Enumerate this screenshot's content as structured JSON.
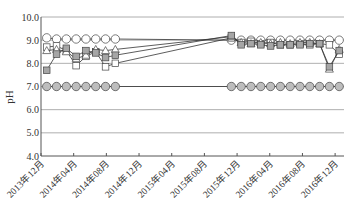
{
  "chart_data": {
    "type": "line",
    "title": "",
    "xlabel": "",
    "ylabel": "pH",
    "ylim": [
      4.0,
      10.0
    ],
    "yticks": [
      "4.0",
      "5.0",
      "6.0",
      "7.0",
      "8.0",
      "9.0",
      "10.0"
    ],
    "grid": "horizontal",
    "legend": "none",
    "x_ticks": [
      {
        "label": "2013年12月",
        "month": 0
      },
      {
        "label": "2014年04月",
        "month": 4
      },
      {
        "label": "2014年08月",
        "month": 8
      },
      {
        "label": "2014年12月",
        "month": 12
      },
      {
        "label": "2015年04月",
        "month": 16
      },
      {
        "label": "2015年08月",
        "month": 20
      },
      {
        "label": "2015年12月",
        "month": 24
      },
      {
        "label": "2016年04月",
        "month": 28
      },
      {
        "label": "2016年08月",
        "month": 32
      },
      {
        "label": "2016年12月",
        "month": 36
      }
    ],
    "x_unit": "months since 2013-12",
    "series": [
      {
        "name": "open-circle",
        "marker": "circle",
        "fill": "#ffffff",
        "x": [
          0.7,
          1.9,
          3.1,
          4.3,
          5.5,
          6.7,
          7.9,
          9.1,
          23.3,
          24.5,
          25.7,
          26.9,
          28.1,
          29.3,
          30.5,
          31.7,
          32.9,
          34.1,
          35.3,
          36.5
        ],
        "values": [
          9.1,
          9.05,
          9.05,
          9.05,
          9.05,
          9.05,
          9.05,
          9.05,
          9.0,
          9.0,
          9.0,
          9.0,
          9.0,
          9.0,
          9.0,
          9.0,
          9.0,
          9.0,
          9.0,
          9.0
        ]
      },
      {
        "name": "grey-circle",
        "marker": "circle",
        "fill": "#bdbdbd",
        "x": [
          0.7,
          1.9,
          3.1,
          4.3,
          5.5,
          6.7,
          7.9,
          9.1,
          23.3,
          24.5,
          25.7,
          26.9,
          28.1,
          29.3,
          30.5,
          31.7,
          32.9,
          34.1,
          35.3,
          36.5
        ],
        "values": [
          7.0,
          7.0,
          7.0,
          7.0,
          7.0,
          7.0,
          7.0,
          7.0,
          7.0,
          7.0,
          7.0,
          7.0,
          7.0,
          7.0,
          7.0,
          7.0,
          7.0,
          7.0,
          7.0,
          7.0
        ]
      },
      {
        "name": "open-square",
        "marker": "square",
        "fill": "#ffffff",
        "x": [
          0.7,
          1.9,
          3.1,
          4.3,
          5.5,
          6.7,
          7.9,
          9.1,
          23.3,
          24.5,
          25.7,
          26.9,
          28.1,
          29.3,
          30.5,
          31.7,
          32.9,
          34.1,
          35.3,
          36.5
        ],
        "values": [
          8.7,
          8.75,
          8.55,
          7.9,
          8.3,
          8.5,
          7.85,
          8.0,
          9.1,
          8.9,
          8.95,
          8.85,
          8.9,
          8.8,
          8.8,
          8.85,
          8.8,
          8.85,
          8.8,
          8.4
        ]
      },
      {
        "name": "open-triangle",
        "marker": "triangle",
        "fill": "#ffffff",
        "x": [
          0.7,
          1.9,
          3.1,
          4.3,
          5.5,
          6.7,
          7.9,
          9.1,
          23.3,
          24.5,
          25.7,
          26.9,
          28.1,
          29.3,
          30.5,
          31.7,
          32.9,
          34.1,
          35.3,
          36.5
        ],
        "values": [
          8.55,
          8.6,
          8.5,
          8.2,
          8.35,
          8.6,
          8.55,
          8.6,
          9.15,
          8.9,
          8.85,
          8.9,
          8.85,
          8.9,
          8.85,
          8.9,
          8.9,
          8.85,
          7.75,
          8.6
        ]
      },
      {
        "name": "grey-square",
        "marker": "square",
        "fill": "#a6a6a6",
        "x": [
          0.7,
          1.9,
          3.1,
          4.3,
          5.5,
          6.7,
          7.9,
          9.1,
          23.3,
          24.5,
          25.7,
          26.9,
          28.1,
          29.3,
          30.5,
          31.7,
          32.9,
          34.1,
          35.3,
          36.5
        ],
        "values": [
          7.7,
          8.4,
          8.65,
          8.3,
          8.55,
          8.45,
          8.25,
          8.35,
          9.2,
          8.8,
          8.85,
          8.8,
          8.75,
          8.8,
          8.8,
          8.8,
          8.85,
          8.85,
          7.85,
          8.55
        ]
      }
    ]
  }
}
